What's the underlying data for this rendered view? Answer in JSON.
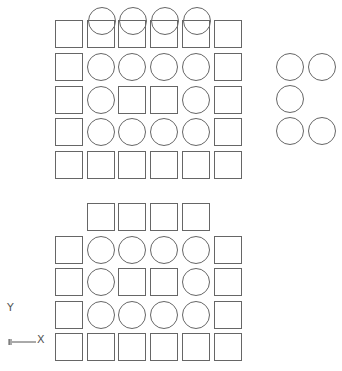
{
  "drawing": {
    "stroke_color": "#666666",
    "background": "#ffffff",
    "shape_size": 27,
    "circle_radius": 13.5
  },
  "upper_block": {
    "columns_x": [
      55,
      87,
      118,
      150,
      182,
      214
    ],
    "rows_y": [
      20,
      53,
      86,
      118,
      151
    ],
    "grid": [
      [
        "S",
        "S",
        "S",
        "S",
        "S",
        "S"
      ],
      [
        "S",
        "C",
        "C",
        "C",
        "C",
        "S"
      ],
      [
        "S",
        "C",
        "S",
        "S",
        "C",
        "S"
      ],
      [
        "S",
        "C",
        "C",
        "C",
        "C",
        "S"
      ],
      [
        "S",
        "S",
        "S",
        "S",
        "S",
        "S"
      ]
    ],
    "overlap_circles": [
      {
        "cx": 102,
        "cy": 21
      },
      {
        "cx": 133,
        "cy": 21
      },
      {
        "cx": 165,
        "cy": 21
      },
      {
        "cx": 197,
        "cy": 21
      }
    ]
  },
  "side_circles": [
    {
      "cx": 290,
      "cy": 67
    },
    {
      "cx": 322,
      "cy": 67
    },
    {
      "cx": 290,
      "cy": 99
    },
    {
      "cx": 290,
      "cy": 131
    },
    {
      "cx": 322,
      "cy": 131
    }
  ],
  "lower_block": {
    "columns_x": [
      55,
      87,
      118,
      150,
      182,
      214
    ],
    "rows_y": [
      203,
      236,
      268,
      301,
      333
    ],
    "grid": [
      [
        "",
        "S",
        "S",
        "S",
        "S",
        ""
      ],
      [
        "S",
        "C",
        "C",
        "C",
        "C",
        "S"
      ],
      [
        "S",
        "C",
        "S",
        "S",
        "C",
        "S"
      ],
      [
        "S",
        "C",
        "C",
        "C",
        "C",
        "S"
      ],
      [
        "S",
        "S",
        "S",
        "S",
        "S",
        "S"
      ]
    ]
  },
  "ucs_icon": {
    "x_label": "X",
    "y_label": "Y"
  }
}
